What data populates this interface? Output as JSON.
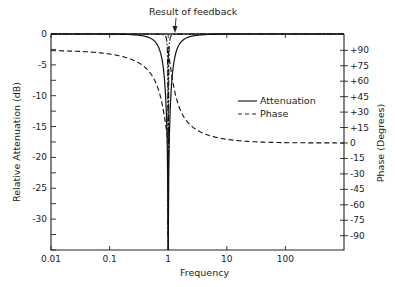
{
  "chart_data": {
    "type": "line",
    "title": "",
    "annotation": "Result of feedback",
    "xlabel": "Frequency",
    "ylabel": "Relative Attenuation (dB)",
    "y2label": "Phase (Degrees)",
    "xscale": "log",
    "xlim": [
      0.01,
      1000
    ],
    "ylim": [
      -35,
      0
    ],
    "y2lim": [
      -105,
      105
    ],
    "x_ticks": [
      0.01,
      0.1,
      1,
      10,
      100
    ],
    "x_tick_labels": [
      "0.01",
      "0.1",
      "1",
      "10",
      "100"
    ],
    "y_ticks": [
      0,
      -5,
      -10,
      -15,
      -20,
      -25,
      -30
    ],
    "y_tick_labels": [
      "0",
      "-5",
      "-10",
      "-15",
      "-20",
      "-25",
      "-30"
    ],
    "y2_ticks": [
      90,
      75,
      60,
      45,
      30,
      15,
      0,
      -15,
      -30,
      -45,
      -60,
      -75,
      -90
    ],
    "y2_tick_labels": [
      "+90",
      "+75",
      "+60",
      "+45",
      "+30",
      "+15",
      "0",
      "-15",
      "-30",
      "-45",
      "-60",
      "-75",
      "-90"
    ],
    "grid": false,
    "legend_position": "right-center",
    "legend": [
      "Attenuation",
      "Phase"
    ],
    "series": [
      {
        "name": "Attenuation",
        "style": "solid",
        "axis": "left",
        "x": [
          0.01,
          0.05,
          0.1,
          0.2,
          0.3,
          0.5,
          0.7,
          0.85,
          0.95,
          1.0,
          1.05,
          1.18,
          1.4,
          2,
          3,
          5,
          10,
          20,
          1000
        ],
        "values": [
          0,
          0,
          -0.1,
          -0.5,
          -1.2,
          -3.5,
          -8,
          -16,
          -27,
          -35,
          -27,
          -16,
          -8,
          -3.5,
          -1.2,
          -0.4,
          -0.1,
          0,
          0
        ]
      },
      {
        "name": "Phase",
        "style": "dashed",
        "axis": "right",
        "x": [
          0.01,
          0.02,
          0.05,
          0.1,
          0.2,
          0.4,
          0.7,
          0.95,
          1.0,
          1.05,
          1.3,
          2,
          3,
          5,
          10,
          20,
          50,
          100,
          1000
        ],
        "values": [
          -2,
          -4,
          -10,
          -18,
          -30,
          -48,
          -70,
          -88,
          90,
          88,
          70,
          48,
          30,
          18,
          8,
          4,
          2,
          1,
          0
        ]
      },
      {
        "name": "Result of feedback",
        "style": "dash-dot",
        "axis": "left",
        "x": [
          0.01,
          0.3,
          0.6,
          0.8,
          0.9,
          0.97,
          1.0,
          1.03,
          1.1,
          1.25,
          1.6,
          3,
          1000
        ],
        "values": [
          0,
          0,
          -0.2,
          -1,
          -3,
          -12,
          -35,
          -12,
          -3,
          -1,
          -0.2,
          0,
          0
        ]
      }
    ]
  }
}
